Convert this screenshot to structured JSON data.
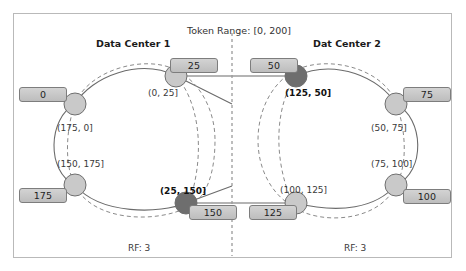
{
  "diagram": {
    "title_left": "Data Center 1",
    "title_right": "Dat Center 2",
    "token_range": "Token Range: [0, 200]",
    "rf_left": "RF: 3",
    "rf_right": "RF: 3",
    "colors": {
      "node_fill": "#c9c9c9",
      "node_fill_highlight": "#6e6e6e",
      "node_stroke": "#6f6f6f",
      "ring_stroke": "#6b6b6b",
      "dashed_stroke": "#8a8a8a",
      "divider": "#9a9a9a",
      "frame": "#b9b9b9",
      "box_face": "#cccccc",
      "text": "#333333"
    },
    "nodes": [
      {
        "token": "0",
        "highlight": false,
        "cx": 75,
        "cy": 104,
        "box_x": 19,
        "box_y": 87,
        "box_w": 48
      },
      {
        "token": "25",
        "highlight": false,
        "cx": 176,
        "cy": 76,
        "box_x": 170,
        "box_y": 58,
        "box_w": 48
      },
      {
        "token": "50",
        "highlight": true,
        "cx": 296,
        "cy": 76,
        "box_x": 250,
        "box_y": 58,
        "box_w": 48
      },
      {
        "token": "75",
        "highlight": false,
        "cx": 396,
        "cy": 104,
        "box_x": 403,
        "box_y": 87,
        "box_w": 48
      },
      {
        "token": "100",
        "highlight": false,
        "cx": 396,
        "cy": 185,
        "box_x": 403,
        "box_y": 189,
        "box_w": 48
      },
      {
        "token": "125",
        "highlight": false,
        "cx": 296,
        "cy": 203,
        "box_x": 249,
        "box_y": 205,
        "box_w": 48
      },
      {
        "token": "150",
        "highlight": true,
        "cx": 186,
        "cy": 203,
        "box_x": 189,
        "box_y": 205,
        "box_w": 48
      },
      {
        "token": "175",
        "highlight": false,
        "cx": 75,
        "cy": 185,
        "box_x": 19,
        "box_y": 188,
        "box_w": 48
      }
    ],
    "range_labels": [
      {
        "text": "(0, 25]",
        "x": 148,
        "y": 89,
        "bold": false
      },
      {
        "text": "(175, 0]",
        "x": 57,
        "y": 124,
        "bold": false
      },
      {
        "text": "(150, 175]",
        "x": 57,
        "y": 160,
        "bold": false
      },
      {
        "text": "(25, 150]",
        "x": 160,
        "y": 187,
        "bold": true
      },
      {
        "text": "(125, 50]",
        "x": 285,
        "y": 89,
        "bold": true
      },
      {
        "text": "(50, 75]",
        "x": 371,
        "y": 124,
        "bold": false
      },
      {
        "text": "(75, 100]",
        "x": 371,
        "y": 160,
        "bold": false
      },
      {
        "text": "(100, 125]",
        "x": 280,
        "y": 186,
        "bold": false
      }
    ],
    "positions": {
      "title_left_x": 96,
      "title_left_y": 39,
      "title_right_x": 313,
      "title_right_y": 39,
      "token_range_x": 187,
      "token_range_y": 26,
      "rf_left_x": 128,
      "rf_left_y": 244,
      "rf_right_x": 344,
      "rf_right_y": 244,
      "divider_x": 232
    }
  }
}
